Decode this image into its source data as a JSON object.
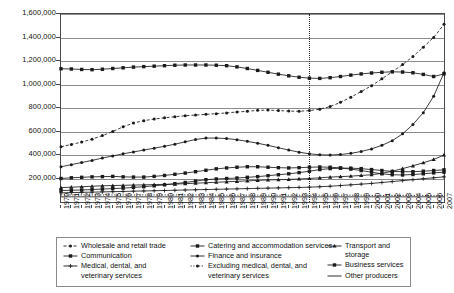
{
  "chart_data": {
    "type": "line",
    "title": "",
    "subtitle": "",
    "xlabel": "",
    "ylabel": "",
    "grid": true,
    "legend_position": "bottom",
    "xlim": [
      1970,
      2007
    ],
    "ylim": [
      0,
      1600000
    ],
    "ytick_values": [
      200000,
      400000,
      600000,
      800000,
      1000000,
      1200000,
      1400000,
      1600000
    ],
    "ytick_labels": [
      "200,000",
      "400,000",
      "600,000",
      "800,000",
      "1,000,000",
      "1,200,000",
      "1,400,000",
      "1,600,000"
    ],
    "x": [
      1970,
      1971,
      1972,
      1973,
      1974,
      1975,
      1976,
      1977,
      1978,
      1979,
      1980,
      1981,
      1982,
      1983,
      1984,
      1985,
      1986,
      1987,
      1988,
      1989,
      1990,
      1991,
      1992,
      1993,
      1994,
      1995,
      1996,
      1997,
      1998,
      1999,
      2000,
      2001,
      2002,
      2003,
      2004,
      2005,
      2006,
      2007
    ],
    "xtick_labels": [
      "1970",
      "1971",
      "1972",
      "1973",
      "1974",
      "1975",
      "1976",
      "1977",
      "1978",
      "1979",
      "1980",
      "1981",
      "1982",
      "1983",
      "1984",
      "1985",
      "1986",
      "1987",
      "1988",
      "1989",
      "1990",
      "1991",
      "1992",
      "1993",
      "1994",
      "1995",
      "1996",
      "1997",
      "1998",
      "1999",
      "2000",
      "2001",
      "2002",
      "2003",
      "2004",
      "2005",
      "2006",
      "2007"
    ],
    "annotations": [
      {
        "type": "vertical-line",
        "x": 1994,
        "style": "dotted",
        "label": ""
      }
    ],
    "series": [
      {
        "name": "Wholesale and retail trade",
        "marker": "dot",
        "line_style": "dashed",
        "values": [
          470000,
          490000,
          510000,
          535000,
          565000,
          600000,
          640000,
          672000,
          692000,
          706000,
          716000,
          726000,
          734000,
          740000,
          746000,
          752000,
          758000,
          766000,
          772000,
          780000,
          782000,
          778000,
          774000,
          772000,
          778000,
          790000,
          812000,
          848000,
          892000,
          940000,
          990000,
          1048000,
          1108000,
          1170000,
          1238000,
          1318000,
          1400000,
          1512000
        ]
      },
      {
        "name": "Catering and accommodation services",
        "marker": "square",
        "line_style": "solid",
        "values": [
          200000,
          206000,
          210000,
          214000,
          216000,
          218000,
          214000,
          212000,
          212000,
          218000,
          226000,
          236000,
          246000,
          258000,
          270000,
          282000,
          290000,
          296000,
          300000,
          300000,
          296000,
          292000,
          290000,
          292000,
          296000,
          298000,
          296000,
          290000,
          280000,
          268000,
          254000,
          240000,
          232000,
          230000,
          234000,
          240000,
          248000,
          254000
        ]
      },
      {
        "name": "Transport and storage",
        "marker": "triangle",
        "line_style": "solid",
        "values": [
          122000,
          126000,
          130000,
          134000,
          138000,
          140000,
          142000,
          144000,
          146000,
          148000,
          150000,
          152000,
          156000,
          160000,
          164000,
          168000,
          172000,
          176000,
          180000,
          184000,
          188000,
          190000,
          192000,
          196000,
          200000,
          206000,
          212000,
          216000,
          220000,
          226000,
          232000,
          244000,
          262000,
          284000,
          308000,
          334000,
          362000,
          400000
        ]
      },
      {
        "name": "Communication",
        "marker": "square",
        "line_style": "solid",
        "values": [
          98000,
          100000,
          102000,
          106000,
          110000,
          114000,
          118000,
          124000,
          130000,
          138000,
          146000,
          156000,
          166000,
          178000,
          190000,
          196000,
          200000,
          204000,
          210000,
          216000,
          224000,
          232000,
          240000,
          250000,
          262000,
          276000,
          284000,
          288000,
          288000,
          284000,
          276000,
          268000,
          260000,
          258000,
          258000,
          262000,
          268000,
          274000
        ]
      },
      {
        "name": "Finance and insurance",
        "marker": "dot",
        "line_style": "solid",
        "values": [
          300000,
          318000,
          336000,
          354000,
          374000,
          392000,
          410000,
          426000,
          442000,
          458000,
          474000,
          492000,
          512000,
          532000,
          544000,
          544000,
          540000,
          530000,
          516000,
          500000,
          482000,
          462000,
          442000,
          424000,
          410000,
          402000,
          400000,
          404000,
          414000,
          430000,
          452000,
          482000,
          522000,
          580000,
          660000,
          760000,
          900000,
          1100000
        ]
      },
      {
        "name": "Business services",
        "marker": "square",
        "line_style": "solid",
        "values": [
          1134000,
          1132000,
          1128000,
          1126000,
          1130000,
          1136000,
          1142000,
          1148000,
          1152000,
          1156000,
          1160000,
          1164000,
          1166000,
          1166000,
          1166000,
          1164000,
          1160000,
          1150000,
          1136000,
          1120000,
          1104000,
          1088000,
          1074000,
          1062000,
          1054000,
          1052000,
          1058000,
          1068000,
          1080000,
          1090000,
          1098000,
          1104000,
          1108000,
          1106000,
          1100000,
          1086000,
          1068000,
          1090000
        ]
      },
      {
        "name": "Medical, dental, and veterinary services",
        "marker": "plus",
        "line_style": "solid",
        "values": [
          78000,
          80000,
          82000,
          84000,
          86000,
          88000,
          90000,
          92000,
          94000,
          96000,
          98000,
          100000,
          102000,
          104000,
          106000,
          108000,
          110000,
          112000,
          114000,
          116000,
          118000,
          120000,
          122000,
          124000,
          126000,
          130000,
          134000,
          140000,
          146000,
          152000,
          158000,
          166000,
          174000,
          182000,
          190000,
          198000,
          206000,
          214000
        ]
      },
      {
        "name": "Excluding medical, dental, and veterinary services",
        "marker": "none",
        "line_style": "dotted",
        "values": [
          60000,
          60000,
          60000,
          60000,
          60000,
          60000,
          60000,
          60000,
          60000,
          60000,
          60000,
          60000,
          60000,
          60000,
          60000,
          58000,
          58000,
          58000,
          58000,
          58000,
          58000,
          58000,
          58000,
          58000,
          58000,
          58000,
          58000,
          58000,
          58000,
          58000,
          56000,
          56000,
          56000,
          56000,
          56000,
          56000,
          54000,
          54000
        ]
      },
      {
        "name": "Other producers",
        "marker": "none",
        "line_style": "solid",
        "values": [
          44000,
          44000,
          44000,
          44000,
          44000,
          44000,
          44000,
          44000,
          44000,
          44000,
          44000,
          44000,
          44000,
          44000,
          44000,
          44000,
          44000,
          44000,
          44000,
          44000,
          44000,
          44000,
          44000,
          44000,
          44000,
          44000,
          44000,
          44000,
          44000,
          44000,
          44000,
          44000,
          44000,
          44000,
          44000,
          44000,
          44000,
          44000
        ]
      }
    ]
  },
  "legend": {
    "columns": [
      {
        "entries": [
          {
            "key": "marker-dot-dashed",
            "label": "Wholesale and retail trade"
          },
          {
            "key": "marker-square-solid",
            "label": "Communication"
          },
          {
            "key": "marker-plus-solid",
            "label": "Medical, dental, and\nveterinary services"
          }
        ]
      },
      {
        "entries": [
          {
            "key": "marker-square-solid",
            "label": "Catering and accommodation services"
          },
          {
            "key": "marker-dot-solid",
            "label": "Finance and insurance"
          },
          {
            "key": "marker-none-dotted",
            "label": "Excluding medical, dental, and\nveterinary services"
          }
        ]
      },
      {
        "entries": [
          {
            "key": "marker-triangle-solid",
            "label": "Transport and storage"
          },
          {
            "key": "marker-square-solid",
            "label": "Business services"
          },
          {
            "key": "marker-none-solid",
            "label": "Other producers"
          }
        ]
      }
    ]
  },
  "colors": {
    "line": "#1a1a1a",
    "grid": "#8c8c8c",
    "frame": "#4a4a4a",
    "background": "#ffffff",
    "text": "#111111"
  }
}
